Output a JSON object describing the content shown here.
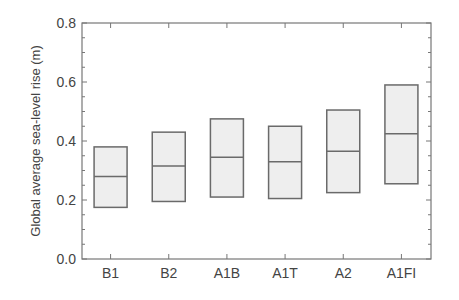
{
  "chart_data": {
    "type": "box",
    "title": "",
    "xlabel": "",
    "ylabel": "Global average sea-level rise (m)",
    "ylim": [
      0.0,
      0.8
    ],
    "yticks": [
      0.0,
      0.2,
      0.4,
      0.6,
      0.8
    ],
    "ytick_labels": [
      "0.0",
      "0.2",
      "0.4",
      "0.6",
      "0.8"
    ],
    "y_minor_step": 0.05,
    "categories": [
      "B1",
      "B2",
      "A1B",
      "A1T",
      "A2",
      "A1FI"
    ],
    "series": [
      {
        "name": "B1",
        "low": 0.175,
        "median": 0.28,
        "high": 0.38
      },
      {
        "name": "B2",
        "low": 0.195,
        "median": 0.315,
        "high": 0.43
      },
      {
        "name": "A1B",
        "low": 0.21,
        "median": 0.345,
        "high": 0.475
      },
      {
        "name": "A1T",
        "low": 0.205,
        "median": 0.33,
        "high": 0.45
      },
      {
        "name": "A2",
        "low": 0.225,
        "median": 0.365,
        "high": 0.505
      },
      {
        "name": "A1FI",
        "low": 0.255,
        "median": 0.425,
        "high": 0.59
      }
    ],
    "grid": false,
    "legend": "none",
    "colors": {
      "box_fill": "#eeeeee",
      "box_stroke": "#6a6a6a",
      "axis": "#777777",
      "text": "#444444"
    }
  }
}
